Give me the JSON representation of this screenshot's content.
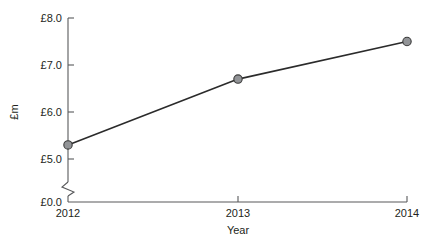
{
  "chart_data": {
    "type": "line",
    "title": "",
    "subtitle": "",
    "xlabel": "Year",
    "ylabel": "£m",
    "categories": [
      "2012",
      "2013",
      "2014"
    ],
    "x": [
      2012,
      2013,
      2014
    ],
    "values": [
      5.3,
      6.7,
      7.5
    ],
    "series": [
      {
        "name": "",
        "values": [
          5.3,
          6.7,
          7.5
        ]
      }
    ],
    "xlim": [
      2012,
      2014
    ],
    "ylim": [
      0.0,
      8.0
    ],
    "y_axis_break": true,
    "y_break_between": [
      0.0,
      5.0
    ],
    "ytick_labels": [
      "£8.0",
      "£7.0",
      "£6.0",
      "£5.0",
      "£0.0"
    ],
    "ytick_values": [
      8.0,
      7.0,
      6.0,
      5.0,
      0.0
    ],
    "xtick_labels": [
      "2012",
      "2013",
      "2014"
    ],
    "grid": false,
    "legend": false,
    "legend_position": "none",
    "marker": "circle",
    "colors": {
      "line": "#2b2b2b",
      "marker_fill": "#929497",
      "marker_stroke": "#3a3a3a",
      "axis": "#58595b",
      "text": "#231f20",
      "background": "#ffffff"
    }
  },
  "axis": {
    "y_label": "£m",
    "x_label": "Year",
    "y_ticks": [
      {
        "label": "£8.0"
      },
      {
        "label": "£7.0"
      },
      {
        "label": "£6.0"
      },
      {
        "label": "£5.0"
      },
      {
        "label": "£0.0"
      }
    ],
    "x_ticks": [
      {
        "label": "2012"
      },
      {
        "label": "2013"
      },
      {
        "label": "2014"
      }
    ]
  }
}
